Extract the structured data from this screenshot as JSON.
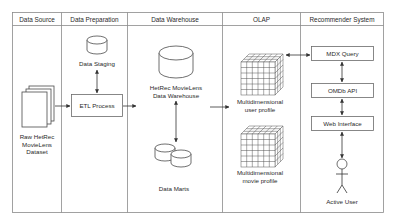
{
  "diagram": {
    "columns": [
      {
        "id": "data-source",
        "label": "Data Source"
      },
      {
        "id": "data-preparation",
        "label": "Data Preparation"
      },
      {
        "id": "data-warehouse",
        "label": "Data Warehouse"
      },
      {
        "id": "olap",
        "label": "OLAP"
      },
      {
        "id": "recommender-system",
        "label": "Recommender System"
      }
    ],
    "nodes": {
      "raw_dataset": {
        "lines": [
          "Raw HetRec",
          "MovieLens",
          "Dataset"
        ],
        "icon": "document-stack-icon"
      },
      "data_staging": {
        "label": "Data Staging",
        "icon": "database-icon"
      },
      "etl_process": {
        "label": "ETL Process"
      },
      "data_warehouse": {
        "lines": [
          "HetRec MovieLens",
          "Data Warehouse"
        ],
        "icon": "database-icon"
      },
      "data_marts": {
        "label": "Data Marts",
        "icon": "databases-icon"
      },
      "user_profile": {
        "lines": [
          "Multidimensional",
          "user profile"
        ],
        "icon": "cube-icon"
      },
      "movie_profile": {
        "lines": [
          "Multidimensional",
          "movie profile"
        ],
        "icon": "cube-icon"
      },
      "mdx_query": {
        "label": "MDX Query"
      },
      "omdb_api": {
        "label": "OMDb API"
      },
      "web_interface": {
        "label": "Web Interface"
      },
      "active_user": {
        "label": "Active User",
        "icon": "actor-icon"
      }
    },
    "edges": [
      {
        "from": "raw_dataset",
        "to": "etl_process",
        "type": "directed"
      },
      {
        "from": "data_staging",
        "to": "etl_process",
        "type": "bidirectional"
      },
      {
        "from": "etl_process",
        "to": "data_warehouse",
        "type": "directed"
      },
      {
        "from": "data_warehouse",
        "to": "data_marts",
        "type": "bidirectional"
      },
      {
        "from": "data_warehouse",
        "to": "user_profile",
        "type": "directed"
      },
      {
        "from": "user_profile",
        "to": "mdx_query",
        "type": "bidirectional"
      },
      {
        "from": "mdx_query",
        "to": "omdb_api",
        "type": "bidirectional"
      },
      {
        "from": "omdb_api",
        "to": "web_interface",
        "type": "bidirectional"
      },
      {
        "from": "web_interface",
        "to": "active_user",
        "type": "bidirectional"
      }
    ]
  }
}
